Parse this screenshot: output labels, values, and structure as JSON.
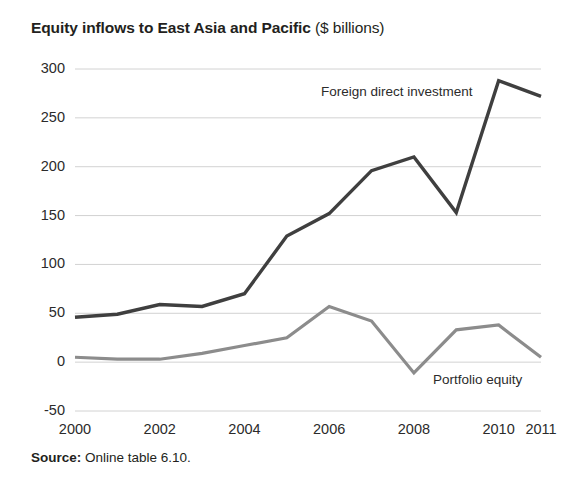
{
  "title": {
    "main": "Equity inflows to East Asia and Pacific",
    "unit": "($ billions)"
  },
  "source": {
    "label": "Source:",
    "text": "Online table 6.10."
  },
  "annotations": {
    "fdi_label": "Foreign direct investment",
    "portfolio_label": "Portfolio equity"
  },
  "colors": {
    "fdi": "#3f3f3f",
    "portfolio": "#8c8c8c",
    "grid": "#d2d2d2",
    "text": "#231f20"
  },
  "chart_data": {
    "type": "line",
    "title": "Equity inflows to East Asia and Pacific ($ billions)",
    "xlabel": "",
    "ylabel": "$ billions",
    "x": [
      2000,
      2001,
      2002,
      2003,
      2004,
      2005,
      2006,
      2007,
      2008,
      2009,
      2010,
      2011
    ],
    "categories": [
      "2000",
      "2001",
      "2002",
      "2003",
      "2004",
      "2005",
      "2006",
      "2007",
      "2008",
      "2009",
      "2010",
      "2011"
    ],
    "xtick_labels": [
      "2000",
      "2002",
      "2004",
      "2006",
      "2008",
      "2010",
      "2011"
    ],
    "xtick_values": [
      2000,
      2002,
      2004,
      2006,
      2008,
      2010,
      2011
    ],
    "ytick_labels": [
      "300",
      "250",
      "200",
      "150",
      "100",
      "50",
      "0",
      "-50"
    ],
    "ytick_values": [
      300,
      250,
      200,
      150,
      100,
      50,
      0,
      -50
    ],
    "ylim": [
      -50,
      300
    ],
    "xlim": [
      2000,
      2011
    ],
    "grid": true,
    "grid_axis": "y",
    "legend": "inline-annotations",
    "series": [
      {
        "name": "Foreign direct investment",
        "color": "#3f3f3f",
        "values": [
          46,
          49,
          59,
          57,
          70,
          129,
          152,
          196,
          210,
          153,
          288,
          272
        ]
      },
      {
        "name": "Portfolio equity",
        "color": "#8c8c8c",
        "values": [
          5,
          3,
          3,
          9,
          17,
          25,
          57,
          42,
          -11,
          33,
          38,
          5
        ]
      }
    ]
  }
}
